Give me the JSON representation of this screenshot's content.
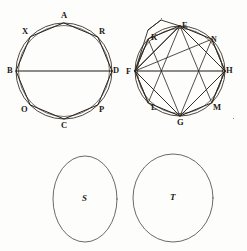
{
  "plate": {
    "background_color": "#fdfdfb",
    "ink_color": "#2b2620",
    "width": 247,
    "height": 251
  },
  "figures": [
    {
      "id": "left-octagon",
      "kind": "octagon-in-circle",
      "center": {
        "x": 64,
        "y": 71
      },
      "radius": 48,
      "has_horizontal_diameter": true,
      "diameter_endpoints": [
        "B",
        "D"
      ],
      "vertices": [
        {
          "label": "A",
          "angle_deg": 270,
          "label_dx": -3,
          "label_dy": -12
        },
        {
          "label": "R",
          "angle_deg": 315,
          "label_dx": 3,
          "label_dy": -10
        },
        {
          "label": "D",
          "angle_deg": 0,
          "label_dx": 3,
          "label_dy": -4
        },
        {
          "label": "P",
          "angle_deg": 45,
          "label_dx": 3,
          "label_dy": 1
        },
        {
          "label": "C",
          "angle_deg": 90,
          "label_dx": -3,
          "label_dy": 3
        },
        {
          "label": "O",
          "angle_deg": 135,
          "label_dx": -11,
          "label_dy": 1
        },
        {
          "label": "B",
          "angle_deg": 180,
          "label_dx": -11,
          "label_dy": -4
        },
        {
          "label": "X",
          "angle_deg": 225,
          "label_dx": -11,
          "label_dy": -10
        }
      ]
    },
    {
      "id": "right-octagon",
      "kind": "octagon-in-circle-with-square",
      "center": {
        "x": 180,
        "y": 71
      },
      "radius": 45,
      "has_horizontal_diameter": true,
      "diameter_endpoints": [
        "F",
        "H"
      ],
      "inner_square": [
        "E",
        "H",
        "G",
        "F"
      ],
      "has_circumscribed_square_corner": true,
      "diagonals_from": [
        "F",
        "H",
        "E",
        "G"
      ],
      "vertices": [
        {
          "label": "E",
          "angle_deg": 270,
          "label_dx": 1,
          "label_dy": -11
        },
        {
          "label": "N",
          "angle_deg": 315,
          "label_dx": 3,
          "label_dy": -10
        },
        {
          "label": "H",
          "angle_deg": 0,
          "label_dx": 2,
          "label_dy": -4
        },
        {
          "label": "M",
          "angle_deg": 45,
          "label_dx": 3,
          "label_dy": 1
        },
        {
          "label": "G",
          "angle_deg": 90,
          "label_dx": -3,
          "label_dy": 3
        },
        {
          "label": "L",
          "angle_deg": 135,
          "label_dx": -11,
          "label_dy": 1
        },
        {
          "label": "F",
          "angle_deg": 180,
          "label_dx": -11,
          "label_dy": -4
        },
        {
          "label": "K",
          "angle_deg": 225,
          "label_dx": -11,
          "label_dy": -10
        }
      ]
    }
  ],
  "plain_circles": [
    {
      "label": "S",
      "center": {
        "x": 85,
        "y": 199
      },
      "rx": 32,
      "ry": 43
    },
    {
      "label": "T",
      "center": {
        "x": 173,
        "y": 198
      },
      "rx": 40,
      "ry": 44
    }
  ],
  "labels": {
    "left_figure": [
      "A",
      "R",
      "D",
      "P",
      "C",
      "O",
      "B",
      "X"
    ],
    "right_figure": [
      "E",
      "N",
      "H",
      "M",
      "G",
      "L",
      "F",
      "K"
    ],
    "bottom_circles": [
      "S",
      "T"
    ]
  }
}
